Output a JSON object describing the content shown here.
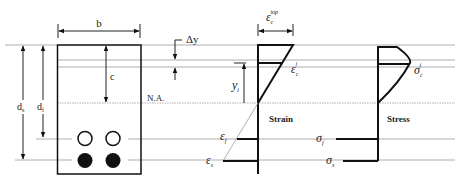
{
  "section": {
    "width_label": "b",
    "depth_c_label": "c",
    "steel_depth_label": "d",
    "steel_depth_sub": "s",
    "frp_depth_label": "d",
    "frp_depth_sub": "f",
    "neutral_axis_label": "N.A.",
    "delta_y_label": "Δy",
    "top_bars": {
      "count": 2,
      "style": "open"
    },
    "bottom_bars": {
      "count": 2,
      "style": "filled"
    }
  },
  "strain": {
    "title": "Strain",
    "top_label": "ε",
    "top_sub": "c",
    "top_sup": "top",
    "layer_label": "ε",
    "layer_sub": "c",
    "layer_sup": "i",
    "yi_label": "y",
    "yi_sub": "i",
    "frp_label": "ε",
    "frp_sub": "f",
    "steel_label": "ε",
    "steel_sub": "s"
  },
  "stress": {
    "title": "Stress",
    "layer_label": "σ",
    "layer_sub": "c",
    "layer_sup": "i",
    "frp_label": "σ",
    "frp_sub": "f",
    "steel_label": "σ",
    "steel_sub": "s"
  }
}
